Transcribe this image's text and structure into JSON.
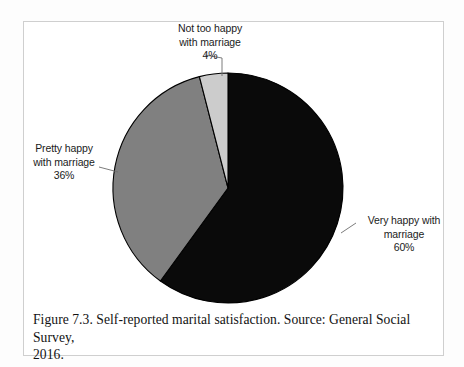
{
  "figure": {
    "caption_line_1": "Figure 7.3. Self-reported marital satisfaction. Source: General Social Survey,",
    "caption_line_2": "2016.",
    "frame_color": "#cfcfcf",
    "background_color": "#ffffff"
  },
  "labels": {
    "not_too_happy": {
      "line1": "Not too happy",
      "line2": "with marriage",
      "value": "4%"
    },
    "pretty_happy": {
      "line1": "Pretty happy",
      "line2": "with marriage",
      "value": "36%"
    },
    "very_happy": {
      "line1": "Very happy with",
      "line2": "marriage",
      "value": "60%"
    }
  },
  "chart_data": {
    "type": "pie",
    "title": "Self-reported marital satisfaction",
    "xlabel": "",
    "ylabel": "",
    "source": "General Social Survey, 2016",
    "legend_position": "callout-labels",
    "grid": false,
    "start_angle_deg": 0,
    "direction": "clockwise",
    "categories": [
      "Very happy with marriage",
      "Pretty happy with marriage",
      "Not too happy with marriage"
    ],
    "values": [
      60,
      36,
      4
    ],
    "value_labels": [
      "60%",
      "36%",
      "4%"
    ],
    "colors": [
      "#0a0a0a",
      "#808080",
      "#cccccc"
    ],
    "slice_stroke": "#000000",
    "slices": [
      {
        "label": "Very happy with marriage",
        "value": 60,
        "value_label": "60%",
        "color": "#0a0a0a",
        "start_deg": 0,
        "end_deg": 216
      },
      {
        "label": "Pretty happy with marriage",
        "value": 36,
        "value_label": "36%",
        "color": "#808080",
        "start_deg": 216,
        "end_deg": 345.6
      },
      {
        "label": "Not too happy with marriage",
        "value": 4,
        "value_label": "4%",
        "color": "#cccccc",
        "start_deg": 345.6,
        "end_deg": 360
      }
    ],
    "total": 100,
    "units": "percent"
  }
}
